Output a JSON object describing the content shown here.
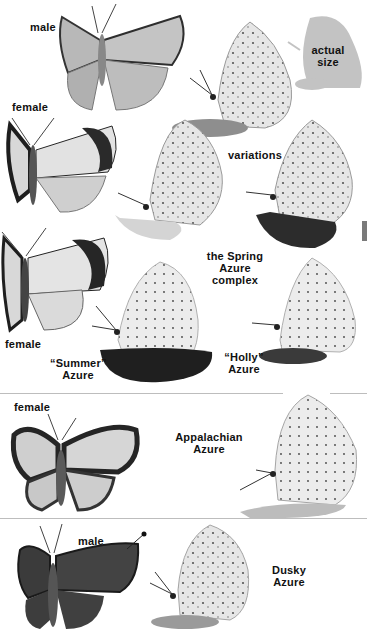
{
  "page": {
    "type": "field-guide-plate",
    "background": "#ffffff"
  },
  "sections": [
    {
      "id": "spring-azure",
      "title": "the Spring Azure complex",
      "labels": {
        "male_top": "male",
        "actual_size": "actual size",
        "female_top": "female",
        "variations": "variations",
        "title_line1": "the Spring",
        "title_line2": "Azure",
        "title_line3": "complex",
        "female_bottom": "female",
        "summer_line1": "“Summer”",
        "summer_line2": "Azure",
        "holly_line1": "“Holly”",
        "holly_line2": "Azure"
      }
    },
    {
      "id": "appalachian-azure",
      "labels": {
        "female": "female",
        "title_line1": "Appalachian",
        "title_line2": "Azure"
      }
    },
    {
      "id": "dusky-azure",
      "labels": {
        "male": "male",
        "title_line1": "Dusky",
        "title_line2": "Azure"
      }
    }
  ],
  "colors": {
    "label_text": "#111111",
    "divider": "#bdbdbd",
    "side_tab": "#7a7a7a",
    "wing_light": "#c9c9c9",
    "wing_pale": "#e4e4e4",
    "wing_dark": "#3a3a3a",
    "silhouette": "#bcbcbc",
    "perch_dark": "#2b2b2b"
  }
}
